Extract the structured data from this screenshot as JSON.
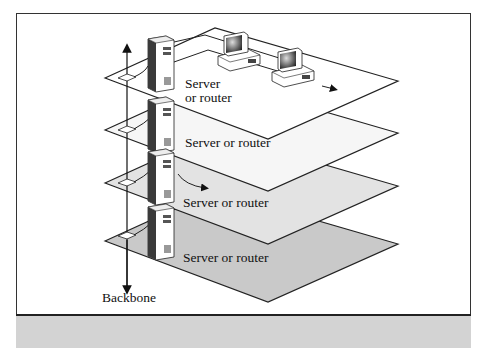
{
  "diagram": {
    "title": "",
    "backbone_label": "Backbone",
    "layers": [
      {
        "label_line1": "Server",
        "label_line2": "or router",
        "fill": "#ffffff"
      },
      {
        "label": "Server or router",
        "fill": "#f6f6f6"
      },
      {
        "label": "Server or router",
        "fill": "#e3e3e3"
      },
      {
        "label": "Server or router",
        "fill": "#c9c9c9"
      }
    ],
    "icons": [
      "server-tower-icon",
      "desktop-computer-icon",
      "arrow-icon"
    ],
    "colors": {
      "frame": "#333333",
      "strip": "#d3d3d3",
      "line": "#222222"
    }
  }
}
